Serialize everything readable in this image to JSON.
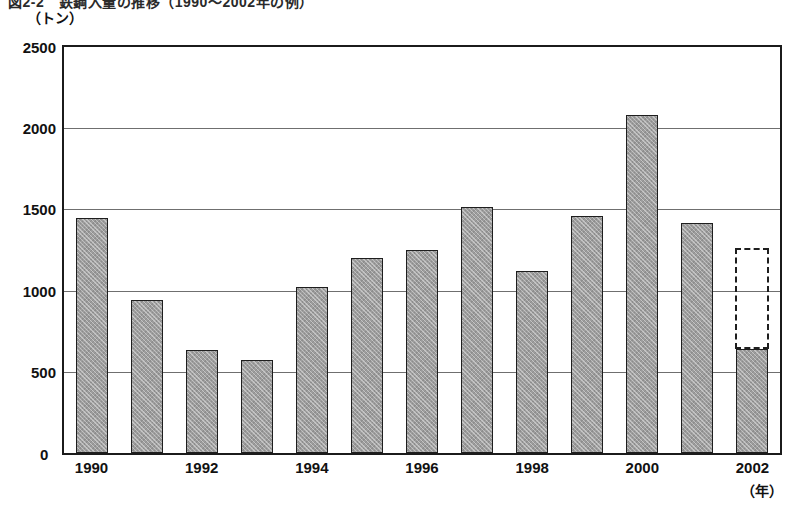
{
  "figure": {
    "title": "図2-2　鉄鋼入量の推移（1990～2002年の例）",
    "y_unit_label": "（トン）",
    "x_unit_label": "（年）",
    "zero_label": "0"
  },
  "chart_data": {
    "type": "bar",
    "title": "図2-2　鉄鋼入量の推移（1990～2002年の例）",
    "xlabel": "（年）",
    "ylabel": "（トン）",
    "ylim": [
      0,
      2500
    ],
    "yticks": [
      0,
      500,
      1000,
      1500,
      2000,
      2500
    ],
    "ytick_labels": [
      "0",
      "500",
      "1000",
      "1500",
      "2000",
      "2500"
    ],
    "xtick_labels": [
      "1990",
      "1992",
      "1994",
      "1996",
      "1998",
      "2000",
      "2002"
    ],
    "grid": true,
    "legend": "none",
    "bar_color": "#9d9d9d",
    "bar_edge_color": "#1e1e1e",
    "categories": [
      "1990",
      "1991",
      "1992",
      "1993",
      "1994",
      "1995",
      "1996",
      "1997",
      "1998",
      "1999",
      "2000",
      "2001",
      "2002"
    ],
    "values": [
      1450,
      945,
      635,
      570,
      1025,
      1200,
      1250,
      1515,
      1120,
      1460,
      2080,
      1415,
      640
    ],
    "projection": {
      "category": "2002",
      "value": 1265,
      "style": "dashed-outline",
      "note": "dashed outline extends above the 2002 solid bar"
    }
  }
}
